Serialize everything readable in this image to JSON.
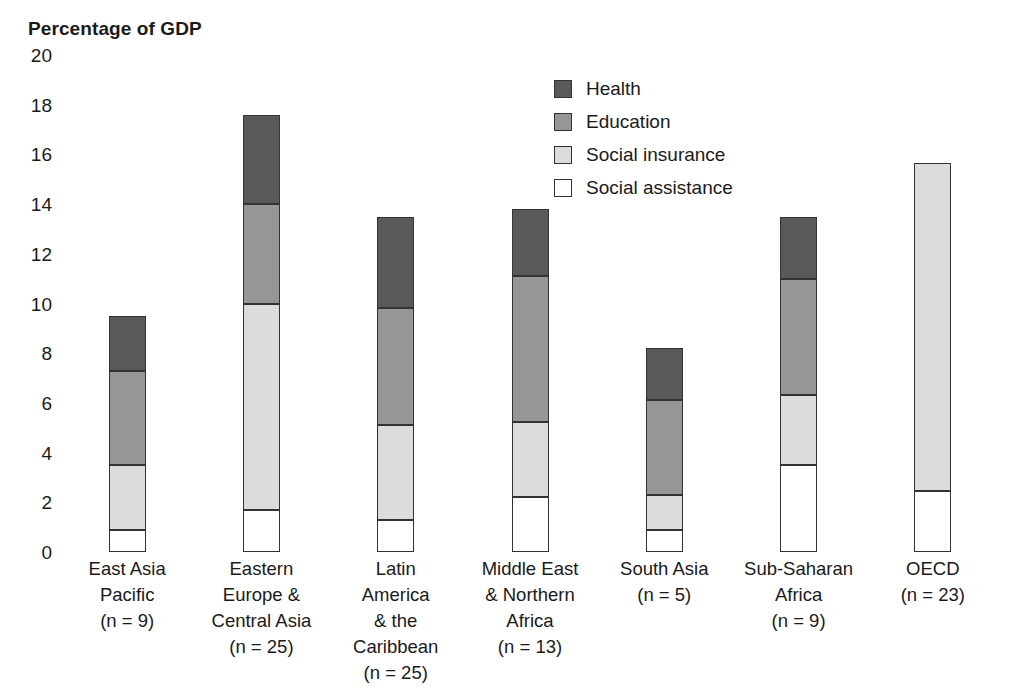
{
  "chart_data": {
    "type": "bar",
    "subtype": "stacked-bar",
    "title": "Percentage of GDP",
    "xlabel": "",
    "ylabel": "Percentage of GDP",
    "ylim": [
      0,
      20
    ],
    "ytick_step": 2,
    "yticks": [
      "20",
      "18",
      "16",
      "14",
      "12",
      "10",
      "8",
      "6",
      "4",
      "2",
      "0"
    ],
    "grid": false,
    "legend_position": "top-center-right",
    "stack_order_bottom_to_top": [
      "Social assistance",
      "Social insurance",
      "Education",
      "Health"
    ],
    "categories": [
      "East Asia Pacific (n = 9)",
      "Eastern Europe & Central Asia (n = 25)",
      "Latin America & the Caribbean (n = 25)",
      "Middle East & Northern Africa (n = 13)",
      "South Asia (n = 5)",
      "Sub-Saharan Africa (n = 9)",
      "OECD (n = 23)"
    ],
    "category_lines": [
      [
        "East Asia",
        "Pacific",
        "(n = 9)"
      ],
      [
        "Eastern",
        "Europe &",
        "Central Asia",
        "(n = 25)"
      ],
      [
        "Latin",
        "America",
        "& the",
        "Caribbean",
        "(n = 25)"
      ],
      [
        "Middle East",
        "& Northern",
        "Africa",
        "(n = 13)"
      ],
      [
        "South Asia",
        "(n = 5)"
      ],
      [
        "Sub-Saharan",
        "Africa",
        "(n = 9)"
      ],
      [
        "OECD",
        "(n = 23)"
      ]
    ],
    "series": [
      {
        "name": "Social assistance",
        "color": "#ffffff",
        "values": [
          0.9,
          1.7,
          1.3,
          2.2,
          0.9,
          3.5,
          2.45
        ]
      },
      {
        "name": "Social insurance",
        "color": "#dcdcdc",
        "values": [
          2.6,
          8.3,
          3.8,
          3.05,
          1.4,
          2.8,
          13.2
        ]
      },
      {
        "name": "Education",
        "color": "#969696",
        "values": [
          3.8,
          4.0,
          4.7,
          5.85,
          3.8,
          4.7,
          0
        ]
      },
      {
        "name": "Health",
        "color": "#595959",
        "values": [
          2.2,
          3.6,
          3.7,
          2.7,
          2.1,
          2.5,
          0
        ]
      }
    ],
    "totals": [
      9.5,
      17.6,
      13.5,
      13.8,
      8.2,
      13.5,
      15.65
    ]
  },
  "legend": {
    "items": [
      {
        "label": "Health",
        "color": "#595959"
      },
      {
        "label": "Education",
        "color": "#969696"
      },
      {
        "label": "Social insurance",
        "color": "#dcdcdc"
      },
      {
        "label": "Social assistance",
        "color": "#ffffff"
      }
    ]
  },
  "style": {
    "border_color": "#333333",
    "background": "#ffffff",
    "text_color": "#1a1a1a"
  }
}
